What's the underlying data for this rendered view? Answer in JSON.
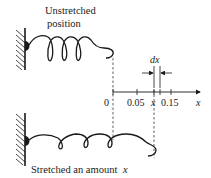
{
  "diagram": {
    "top_label_line1": "Unstretched",
    "top_label_line2": "position",
    "bottom_label": "Stretched an amount",
    "bottom_label_var": "x",
    "dx_label": "dx",
    "axis": {
      "variable": "x",
      "tick_labels": [
        "0",
        "0.05",
        "x",
        "0.15"
      ]
    },
    "colors": {
      "ink": "#1a1a1a",
      "background": "#ffffff"
    }
  }
}
